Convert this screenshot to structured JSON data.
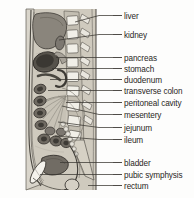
{
  "figure": {
    "type": "anatomical-diagram",
    "orientation": "sagittal",
    "background_color": "#fdfdfc",
    "drawing_tint": "#b9b4a8",
    "line_color": "#3a3732"
  },
  "labels": [
    {
      "id": "liver",
      "text": "liver",
      "text_x": 124,
      "text_y": 12,
      "line_x1": 113,
      "line_y1": 15.5,
      "line_x2": 122,
      "line_y2": 15.5,
      "leader_x": 75,
      "leader_y": 22
    },
    {
      "id": "kidney",
      "text": "kidney",
      "text_x": 124,
      "text_y": 31,
      "line_x1": 113,
      "line_y1": 34.5,
      "line_x2": 122,
      "line_y2": 34.5,
      "leader_x": 59,
      "leader_y": 40
    },
    {
      "id": "pancreas",
      "text": "pancreas",
      "text_x": 124,
      "text_y": 54,
      "line_x1": 113,
      "line_y1": 57.5,
      "line_x2": 122,
      "line_y2": 57.5,
      "leader_x": 56,
      "leader_y": 57.5
    },
    {
      "id": "stomach",
      "text": "stomach",
      "text_x": 124,
      "text_y": 65,
      "line_x1": 113,
      "line_y1": 68.5,
      "line_x2": 122,
      "line_y2": 68.5,
      "leader_x": 52,
      "leader_y": 68.5
    },
    {
      "id": "duodenum",
      "text": "duodenum",
      "text_x": 124,
      "text_y": 76,
      "line_x1": 113,
      "line_y1": 79.5,
      "line_x2": 122,
      "line_y2": 79.5,
      "leader_x": 50,
      "leader_y": 79.5
    },
    {
      "id": "transverse-colon",
      "text": "transverse colon",
      "text_x": 124,
      "text_y": 87,
      "line_x1": 113,
      "line_y1": 90.5,
      "line_x2": 122,
      "line_y2": 90.5,
      "leader_x": 48,
      "leader_y": 90.5
    },
    {
      "id": "peritoneal-cavity",
      "text": "peritoneal cavity",
      "text_x": 124,
      "text_y": 99,
      "line_x1": 113,
      "line_y1": 102.5,
      "line_x2": 122,
      "line_y2": 102.5,
      "leader_x": 66,
      "leader_y": 102.5
    },
    {
      "id": "mesentery",
      "text": "mesentery",
      "text_x": 124,
      "text_y": 111,
      "line_x1": 113,
      "line_y1": 114.5,
      "line_x2": 122,
      "line_y2": 114.5,
      "leader_x": 62,
      "leader_y": 106
    },
    {
      "id": "jejunum",
      "text": "jejunum",
      "text_x": 124,
      "text_y": 124,
      "line_x1": 113,
      "line_y1": 127.5,
      "line_x2": 122,
      "line_y2": 127.5,
      "leader_x": 58,
      "leader_y": 122
    },
    {
      "id": "ileum",
      "text": "ileum",
      "text_x": 124,
      "text_y": 136,
      "line_x1": 113,
      "line_y1": 139.5,
      "line_x2": 122,
      "line_y2": 139.5,
      "leader_x": 55,
      "leader_y": 136
    },
    {
      "id": "bladder",
      "text": "bladder",
      "text_x": 124,
      "text_y": 159,
      "line_x1": 113,
      "line_y1": 162.5,
      "line_x2": 122,
      "line_y2": 162.5,
      "leader_x": 60,
      "leader_y": 162.5
    },
    {
      "id": "pubic-symphysis",
      "text": "pubic symphysis",
      "text_x": 124,
      "text_y": 171,
      "line_x1": 113,
      "line_y1": 174.5,
      "line_x2": 122,
      "line_y2": 174.5,
      "leader_x": 40,
      "leader_y": 174.5
    },
    {
      "id": "rectum",
      "text": "rectum",
      "text_x": 124,
      "text_y": 182,
      "line_x1": 113,
      "line_y1": 185.5,
      "line_x2": 122,
      "line_y2": 185.5,
      "leader_x": 88,
      "leader_y": 185.5
    }
  ],
  "colors": {
    "body_fill": "#c8c3b6",
    "body_fill_light": "#d8d4c9",
    "organ_dark": "#6e6a62",
    "organ_mid": "#9a958b",
    "organ_light": "#c4bfb3",
    "bone_white": "#f0eee7",
    "outline": "#3b3833",
    "label_text": "#2a2724"
  }
}
